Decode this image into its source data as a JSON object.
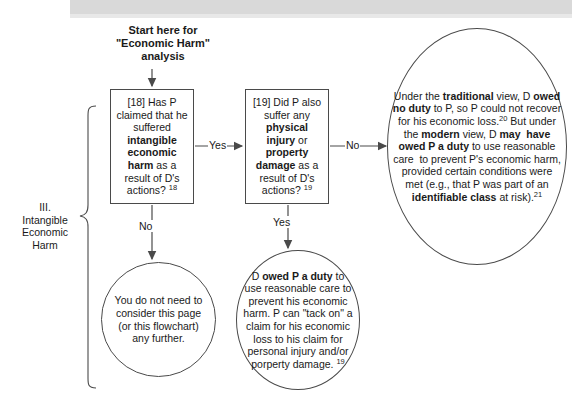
{
  "document": {
    "kind": "flowchart",
    "title": "Economic Harm analysis flowchart"
  },
  "start": {
    "line1": "Start here for",
    "line2": "\"Economic Harm\"",
    "line3": "analysis"
  },
  "section": {
    "numeral": "III.",
    "line1": "Intangible",
    "line2": "Economic",
    "line3": "Harm"
  },
  "nodes": {
    "box18": {
      "tag": "[18]",
      "text_plain": "[18] Has P claimed that he suffered intangible economic harm as a result of D's actions? 18",
      "html": "[18] Has P claimed that he suffered <b>intangible economic harm</b> as a result of D's actions? <sup>18</sup>"
    },
    "box19": {
      "tag": "[19]",
      "text_plain": "[19] Did P also suffer any physical injury or property damage as a result of D's actions? 19",
      "html": "[19] Did P also suffer any <b>physical injury</b> or <b>property damage</b> as a result of D's actions? <sup>19</sup>"
    },
    "no_need": {
      "text_plain": "You do not need to consider this page (or this flowchart) any further.",
      "html": "You do not need to consider this page (or this flowchart) any further."
    },
    "tack_on": {
      "text_plain": "D owed P a duty to use reasonable care to prevent his economic harm. P can \"tack on\" a claim for his economic loss to his claim for personal injury and/or porperty damage. 19",
      "html": "D <b>owed P a duty</b> to use reasonable care to prevent his economic harm. P can \"tack on\" a claim for his economic loss to his claim for personal injury and/or porperty damage. <sup>19</sup>"
    },
    "views": {
      "text_plain": "Under the traditional view, D owed no duty to P, so P could not recover for his economic loss.20 But under the modern view, D may have owed P a duty to use reasonable care to prevent P's economic harm, provided certain conditions were met (e.g., that P was part of an identifiable class at risk).21",
      "html": "Under the <b>traditional</b> view, D <b>owed no duty</b> to P, so P could not recover for his economic loss.<sup>20</sup> But under the <b>modern</b> view, D <b>may&nbsp; have owed P a duty</b> to use reasonable care&nbsp; to prevent P's economic harm, provided certain conditions were met (e.g., that P was part of an <b>identifiable class</b> at risk).<sup>21</sup>"
    }
  },
  "edges": {
    "box18_yes": "Yes",
    "box18_no": "No",
    "box19_no": "No",
    "box19_yes": "Yes"
  },
  "colors": {
    "stroke": "#4a4a4a",
    "text": "#1a1a1a",
    "background": "#ffffff",
    "scan_band": "#d9d9d9"
  }
}
